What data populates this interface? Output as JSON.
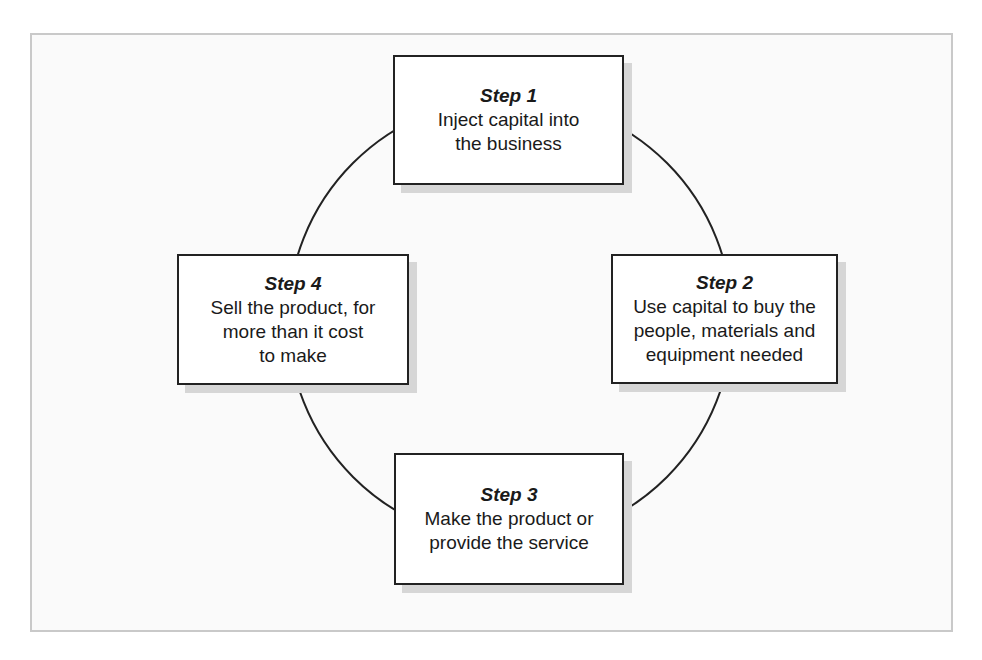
{
  "diagram": {
    "type": "cycle",
    "colors": {
      "frame_border": "#c9c9c9",
      "box_border": "#222222",
      "box_shadow": "#d6d6d6",
      "text": "#1a1a1a",
      "connector": "#222222"
    },
    "steps": [
      {
        "title": "Step 1",
        "text": "Inject capital into\nthe business"
      },
      {
        "title": "Step 2",
        "text": "Use capital to buy the\npeople, materials and\nequipment needed"
      },
      {
        "title": "Step 3",
        "text": "Make the product or\nprovide the service"
      },
      {
        "title": "Step 4",
        "text": "Sell the product, for\nmore than it cost\nto make"
      }
    ]
  }
}
